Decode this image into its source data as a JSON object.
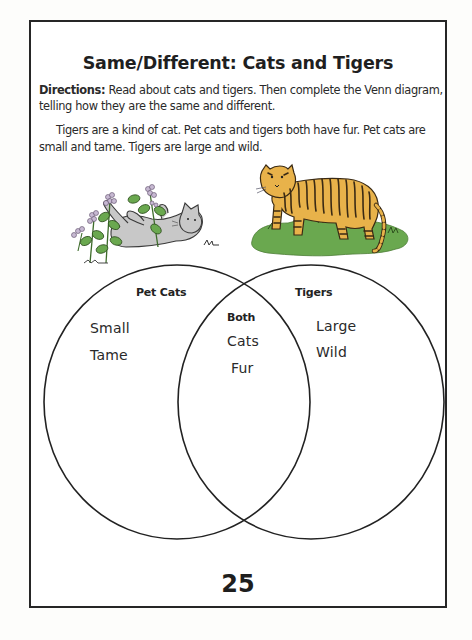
{
  "worksheet": {
    "title": "Same/Different: Cats and Tigers",
    "directions": {
      "label": "Directions:",
      "text": " Read about cats and tigers. Then complete the Venn diagram, telling how they are the same and different."
    },
    "passage": "Tigers are a kind of cat. Pet cats and tigers both have fur. Pet cats are small and tame. Tigers are large and wild.",
    "illustrations": {
      "left": "cat-among-flowers",
      "right": "tiger-on-grass"
    },
    "venn": {
      "left": {
        "heading": "Pet Cats",
        "items": [
          "Small",
          "Tame"
        ]
      },
      "overlap": {
        "heading": "Both",
        "items": [
          "Cats",
          "Fur"
        ]
      },
      "right": {
        "heading": "Tigers",
        "items": [
          "Large",
          "Wild"
        ]
      }
    },
    "page_number": "25"
  },
  "colors": {
    "ink": "#262626",
    "cat_fill": "#c9c9c9",
    "leaf_green": "#5a9a3a",
    "flower_lilac": "#b8a6c4",
    "tiger_orange": "#e8b24a",
    "tiger_stripe": "#3a2a14",
    "grass_green": "#6aa84f"
  }
}
